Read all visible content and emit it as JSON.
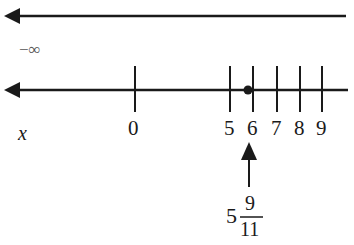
{
  "diagram": {
    "top_line": {
      "label": "−∞"
    },
    "number_line": {
      "variable_label": "x",
      "ticks": [
        {
          "value": "0",
          "x": 135
        },
        {
          "value": "5",
          "x": 230
        },
        {
          "value": "6",
          "x": 253
        },
        {
          "value": "7",
          "x": 277
        },
        {
          "value": "8",
          "x": 300
        },
        {
          "value": "9",
          "x": 322
        }
      ],
      "point": {
        "whole": "5",
        "numerator": "9",
        "denominator": "11"
      }
    },
    "colors": {
      "line": "#1a1a1a",
      "background": "#ffffff"
    }
  }
}
